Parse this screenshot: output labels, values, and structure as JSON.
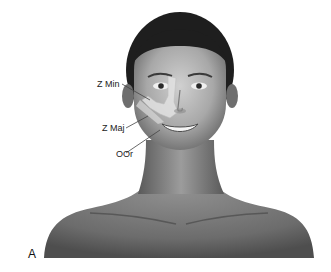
{
  "figure": {
    "panel_label": "A",
    "labels": [
      {
        "id": "z-min",
        "text": "Z Min",
        "meaning": "zygomaticus minor"
      },
      {
        "id": "z-maj",
        "text": "Z Maj",
        "meaning": "zygomaticus major"
      },
      {
        "id": "oor",
        "text": "OOr",
        "meaning": "orbicularis oris"
      }
    ],
    "colors": {
      "background": "#ffffff",
      "hair": "#1e1e1e",
      "skin_light": "#c8c8c8",
      "skin_mid": "#9a9a9a",
      "skin_dark": "#6e6e6e",
      "muscle_highlight": "#e2e2e2",
      "label_text": "#222222",
      "leader_line": "#444444"
    }
  }
}
